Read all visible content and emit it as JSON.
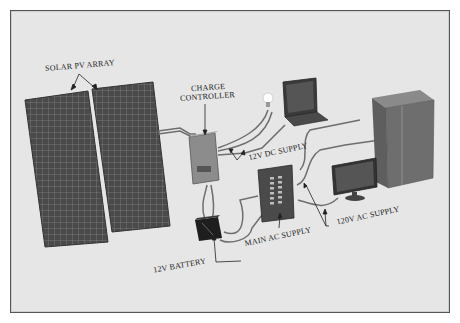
{
  "diagram": {
    "components": [
      {
        "id": "solar-pv-array",
        "label": "SOLAR PV ARRAY"
      },
      {
        "id": "charge-controller",
        "label_line1": "CHARGE",
        "label_line2": "CONTROLLER"
      },
      {
        "id": "dc-supply",
        "label": "12V DC SUPPLY"
      },
      {
        "id": "battery",
        "label": "12V BATTERY"
      },
      {
        "id": "main-ac-supply",
        "label": "MAIN AC SUPPLY"
      },
      {
        "id": "ac-supply",
        "label": "120V AC SUPPLY"
      }
    ],
    "devices": [
      "light-bulb",
      "laptop",
      "refrigerator",
      "monitor"
    ],
    "colors": {
      "background": "#e6e6e6",
      "frame_border": "#555555",
      "panel": "#4a4a4a",
      "panel_grid": "#8a8a8a",
      "device_dark": "#3a3a3a",
      "controller": "#8c8c8c",
      "cable": "#6e6e6e"
    }
  }
}
